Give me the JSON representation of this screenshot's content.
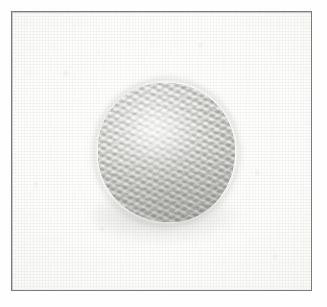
{
  "figure": {
    "caption": "",
    "subject_label": "yarn-ball",
    "background_label": "plain pale studio backdrop",
    "frame_label": "thin rectangular photo border"
  },
  "colors": {
    "page_background": "#ffffff",
    "frame_border": "#7a7a7e",
    "photo_background": "#fcfcfb",
    "ball_light": "#e9e9e6",
    "ball_mid": "#c2c2bc",
    "ball_dark": "#9e9e98",
    "ball_shadow": "#969694",
    "yarn_highlight": "#ffffff"
  },
  "geometry": {
    "image_width": 327,
    "image_height": 307,
    "frame_left": 11,
    "frame_top": 11,
    "frame_width": 301,
    "frame_height": 280,
    "ball_center_x": 165,
    "ball_center_y": 151,
    "ball_width": 137,
    "ball_height": 139
  },
  "texture": {
    "pattern": "diagonal knit stitches",
    "stitch_angle_degrees": 26,
    "secondary_angle_degrees": -34,
    "lighting": "soft upper-left key light"
  }
}
